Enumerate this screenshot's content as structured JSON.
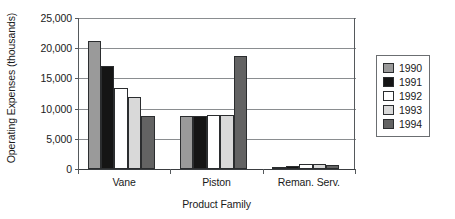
{
  "chart_data": {
    "type": "bar",
    "title": "",
    "subtitle": "",
    "xlabel": "Product Family",
    "ylabel": "Operating Expenses (thousands)",
    "categories": [
      "Vane",
      "Piston",
      "Reman. Serv."
    ],
    "series": [
      {
        "name": "1990",
        "color": "#9a9a9a",
        "values": [
          21200,
          8700,
          400
        ]
      },
      {
        "name": "1991",
        "color": "#151515",
        "values": [
          17000,
          8700,
          550
        ]
      },
      {
        "name": "1992",
        "color": "#ffffff",
        "values": [
          13400,
          8900,
          800
        ]
      },
      {
        "name": "1993",
        "color": "#d9d9d9",
        "values": [
          11900,
          8900,
          800
        ]
      },
      {
        "name": "1994",
        "color": "#636363",
        "values": [
          8800,
          18700,
          600
        ]
      }
    ],
    "ylim": [
      0,
      25000
    ],
    "ytick_values": [
      0,
      5000,
      10000,
      15000,
      20000,
      25000
    ],
    "ytick_labels": [
      "0",
      "5,000",
      "10,000",
      "15,000",
      "20,000",
      "25,000"
    ],
    "grid": true,
    "legend_position": "right",
    "legend_entries": [
      "1990",
      "1991",
      "1992",
      "1993",
      "1994"
    ]
  },
  "axes": {
    "y_title": "Operating Expenses (thousands)",
    "x_title": "Product Family"
  }
}
